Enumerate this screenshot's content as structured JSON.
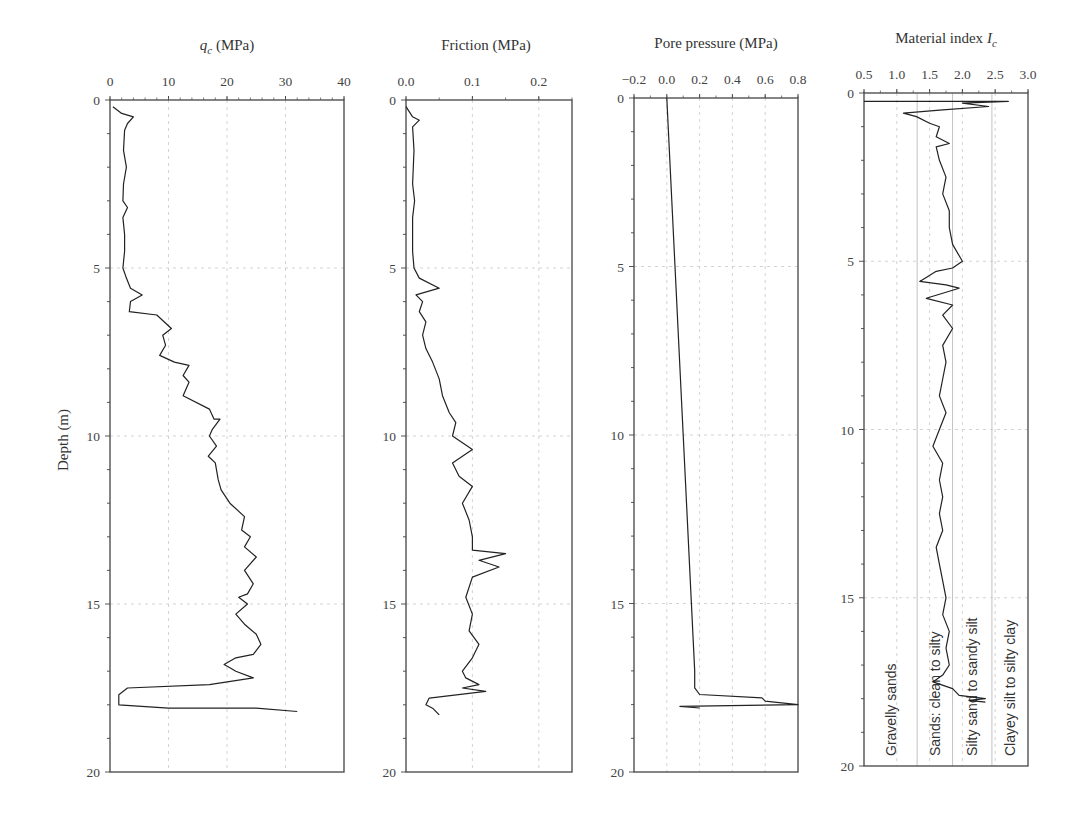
{
  "figure": {
    "ylabel": "Depth (m)",
    "y_ticks": [
      "0",
      "5",
      "10",
      "15",
      "20"
    ]
  },
  "chart_data": [
    {
      "type": "line",
      "title": "q_c (MPa)",
      "title_main": "q",
      "title_sub": "c",
      "title_unit": " (MPa)",
      "xlabel": "q_c (MPa)",
      "ylabel": "Depth (m)",
      "xlim": [
        0,
        40
      ],
      "ylim": [
        20,
        0
      ],
      "x_ticks": [
        0,
        10,
        20,
        30,
        40
      ],
      "x_tick_labels": [
        "0",
        "10",
        "20",
        "30",
        "40"
      ],
      "y_ticks": [
        0,
        5,
        10,
        15,
        20
      ],
      "grid": true,
      "series": [
        {
          "name": "q_c",
          "points": [
            [
              0.5,
              0.2
            ],
            [
              2,
              0.4
            ],
            [
              4,
              0.5
            ],
            [
              3,
              0.7
            ],
            [
              2.5,
              0.9
            ],
            [
              2.3,
              1.5
            ],
            [
              2.8,
              2.0
            ],
            [
              2.3,
              2.5
            ],
            [
              2.2,
              3.0
            ],
            [
              3,
              3.2
            ],
            [
              2.2,
              3.5
            ],
            [
              2.5,
              4.0
            ],
            [
              2.5,
              4.5
            ],
            [
              2.2,
              5.0
            ],
            [
              2.8,
              5.3
            ],
            [
              3.5,
              5.6
            ],
            [
              5.5,
              5.8
            ],
            [
              3.5,
              6.0
            ],
            [
              3.3,
              6.3
            ],
            [
              8,
              6.4
            ],
            [
              10.5,
              6.8
            ],
            [
              9,
              7.0
            ],
            [
              9.5,
              7.3
            ],
            [
              8.5,
              7.6
            ],
            [
              11,
              7.8
            ],
            [
              13.5,
              7.9
            ],
            [
              12.5,
              8.2
            ],
            [
              13.5,
              8.4
            ],
            [
              12.5,
              8.8
            ],
            [
              17,
              9.2
            ],
            [
              17.8,
              9.5
            ],
            [
              18.8,
              9.5
            ],
            [
              17.5,
              9.8
            ],
            [
              17,
              10.0
            ],
            [
              18.2,
              10.3
            ],
            [
              16.8,
              10.6
            ],
            [
              18,
              10.8
            ],
            [
              18.5,
              11.3
            ],
            [
              19,
              11.6
            ],
            [
              20.5,
              12.0
            ],
            [
              23,
              12.4
            ],
            [
              22.5,
              12.8
            ],
            [
              24,
              13.0
            ],
            [
              23,
              13.3
            ],
            [
              25,
              13.6
            ],
            [
              23,
              14.0
            ],
            [
              24.5,
              14.4
            ],
            [
              23.5,
              14.7
            ],
            [
              22,
              14.8
            ],
            [
              23.5,
              15.0
            ],
            [
              21.5,
              15.3
            ],
            [
              23,
              15.6
            ],
            [
              25,
              15.9
            ],
            [
              25.8,
              16.2
            ],
            [
              24.5,
              16.5
            ],
            [
              21.5,
              16.6
            ],
            [
              19.5,
              16.8
            ],
            [
              20.5,
              16.9
            ],
            [
              21.5,
              17.0
            ],
            [
              24.5,
              17.2
            ],
            [
              17,
              17.4
            ],
            [
              3,
              17.5
            ],
            [
              1.5,
              17.7
            ],
            [
              1.5,
              18.0
            ],
            [
              10,
              18.1
            ],
            [
              25,
              18.1
            ],
            [
              32,
              18.2
            ]
          ]
        }
      ]
    },
    {
      "type": "line",
      "title": "Friction (MPa)",
      "xlabel": "Friction (MPa)",
      "ylabel": "Depth (m)",
      "xlim": [
        0.0,
        0.25
      ],
      "ylim": [
        20,
        0
      ],
      "x_ticks": [
        0.0,
        0.1,
        0.2
      ],
      "x_tick_labels": [
        "0.0",
        "0.1",
        "0.2"
      ],
      "y_ticks": [
        0,
        5,
        10,
        15,
        20
      ],
      "grid": true,
      "series": [
        {
          "name": "Friction",
          "points": [
            [
              0.0,
              0.2
            ],
            [
              0.01,
              0.5
            ],
            [
              0.02,
              0.6
            ],
            [
              0.01,
              0.8
            ],
            [
              0.012,
              1.5
            ],
            [
              0.01,
              2.5
            ],
            [
              0.013,
              3.0
            ],
            [
              0.01,
              3.5
            ],
            [
              0.01,
              4.5
            ],
            [
              0.012,
              5.0
            ],
            [
              0.02,
              5.3
            ],
            [
              0.05,
              5.6
            ],
            [
              0.015,
              5.8
            ],
            [
              0.025,
              6.0
            ],
            [
              0.02,
              6.3
            ],
            [
              0.03,
              6.6
            ],
            [
              0.025,
              7.0
            ],
            [
              0.03,
              7.4
            ],
            [
              0.04,
              7.8
            ],
            [
              0.05,
              8.3
            ],
            [
              0.055,
              8.8
            ],
            [
              0.065,
              9.3
            ],
            [
              0.075,
              9.6
            ],
            [
              0.07,
              10.0
            ],
            [
              0.1,
              10.4
            ],
            [
              0.07,
              10.8
            ],
            [
              0.08,
              11.2
            ],
            [
              0.1,
              11.5
            ],
            [
              0.085,
              12.0
            ],
            [
              0.095,
              12.5
            ],
            [
              0.1,
              13.0
            ],
            [
              0.1,
              13.4
            ],
            [
              0.15,
              13.5
            ],
            [
              0.11,
              13.7
            ],
            [
              0.14,
              13.9
            ],
            [
              0.1,
              14.2
            ],
            [
              0.09,
              14.8
            ],
            [
              0.1,
              15.3
            ],
            [
              0.095,
              15.8
            ],
            [
              0.11,
              16.2
            ],
            [
              0.1,
              16.6
            ],
            [
              0.085,
              17.0
            ],
            [
              0.09,
              17.2
            ],
            [
              0.11,
              17.4
            ],
            [
              0.085,
              17.5
            ],
            [
              0.12,
              17.6
            ],
            [
              0.035,
              17.8
            ],
            [
              0.03,
              18.0
            ],
            [
              0.04,
              18.1
            ],
            [
              0.05,
              18.3
            ]
          ]
        }
      ]
    },
    {
      "type": "line",
      "title": "Pore pressure (MPa)",
      "xlabel": "Pore pressure (MPa)",
      "ylabel": "Depth (m)",
      "xlim": [
        -0.2,
        0.8
      ],
      "ylim": [
        20,
        0
      ],
      "x_ticks": [
        -0.2,
        0.0,
        0.2,
        0.4,
        0.6,
        0.8
      ],
      "x_tick_labels": [
        "−0.2",
        "0.0",
        "0.2",
        "0.4",
        "0.6",
        "0.8"
      ],
      "y_ticks": [
        0,
        5,
        10,
        15,
        20
      ],
      "grid": true,
      "series": [
        {
          "name": "Pore pressure",
          "points": [
            [
              0.0,
              0.0
            ],
            [
              0.05,
              5.0
            ],
            [
              0.1,
              10.0
            ],
            [
              0.15,
              15.0
            ],
            [
              0.17,
              17.0
            ],
            [
              0.17,
              17.5
            ],
            [
              0.2,
              17.7
            ],
            [
              0.58,
              17.8
            ],
            [
              0.6,
              17.9
            ],
            [
              0.8,
              18.0
            ],
            [
              0.08,
              18.05
            ],
            [
              0.2,
              18.1
            ]
          ]
        }
      ]
    },
    {
      "type": "line",
      "title": "Material index I_c",
      "title_main": "Material index I",
      "title_sub": "c",
      "xlabel": "Material index I_c",
      "ylabel": "Depth (m)",
      "xlim": [
        0.5,
        3.0
      ],
      "ylim": [
        20,
        0
      ],
      "x_ticks": [
        0.5,
        1.0,
        1.5,
        2.0,
        2.5,
        3.0
      ],
      "x_tick_labels": [
        "0.5",
        "1.0",
        "1.5",
        "2.0",
        "2.5",
        "3.0"
      ],
      "y_ticks": [
        0,
        5,
        10,
        15,
        20
      ],
      "grid": true,
      "zones": [
        {
          "label": "Gravelly sands",
          "x_from": 0.5,
          "x_to": 1.31
        },
        {
          "label": "Sands: clean to silty",
          "x_from": 1.31,
          "x_to": 1.85
        },
        {
          "label": "Silty sand to sandy silt",
          "x_from": 1.85,
          "x_to": 2.45
        },
        {
          "label": "Clayey silt to silty clay",
          "x_from": 2.45,
          "x_to": 3.0
        }
      ],
      "series": [
        {
          "name": "I_c",
          "points": [
            [
              0.5,
              0.25
            ],
            [
              2.7,
              0.25
            ],
            [
              2.0,
              0.3
            ],
            [
              2.4,
              0.4
            ],
            [
              1.7,
              0.5
            ],
            [
              1.1,
              0.6
            ],
            [
              1.3,
              0.7
            ],
            [
              1.5,
              0.9
            ],
            [
              1.65,
              1.0
            ],
            [
              1.6,
              1.3
            ],
            [
              1.8,
              1.5
            ],
            [
              1.6,
              1.6
            ],
            [
              1.65,
              2.0
            ],
            [
              1.75,
              2.5
            ],
            [
              1.7,
              3.0
            ],
            [
              1.8,
              3.5
            ],
            [
              1.8,
              4.0
            ],
            [
              1.85,
              4.5
            ],
            [
              2.0,
              5.0
            ],
            [
              1.85,
              5.2
            ],
            [
              1.6,
              5.3
            ],
            [
              1.35,
              5.6
            ],
            [
              1.75,
              5.7
            ],
            [
              1.95,
              5.8
            ],
            [
              1.45,
              6.1
            ],
            [
              1.85,
              6.3
            ],
            [
              1.7,
              6.6
            ],
            [
              1.85,
              7.0
            ],
            [
              1.7,
              7.5
            ],
            [
              1.75,
              8.0
            ],
            [
              1.7,
              8.5
            ],
            [
              1.65,
              9.0
            ],
            [
              1.75,
              9.5
            ],
            [
              1.65,
              10.0
            ],
            [
              1.55,
              10.5
            ],
            [
              1.7,
              11.0
            ],
            [
              1.65,
              11.5
            ],
            [
              1.7,
              12.0
            ],
            [
              1.65,
              12.5
            ],
            [
              1.7,
              13.0
            ],
            [
              1.6,
              13.5
            ],
            [
              1.65,
              14.0
            ],
            [
              1.7,
              14.5
            ],
            [
              1.75,
              15.0
            ],
            [
              1.7,
              15.5
            ],
            [
              1.8,
              16.0
            ],
            [
              1.75,
              16.5
            ],
            [
              1.8,
              17.0
            ],
            [
              1.7,
              17.3
            ],
            [
              1.55,
              17.5
            ],
            [
              1.85,
              17.7
            ],
            [
              1.95,
              17.9
            ],
            [
              2.35,
              18.0
            ],
            [
              2.1,
              18.05
            ],
            [
              2.35,
              18.1
            ]
          ]
        }
      ]
    }
  ]
}
